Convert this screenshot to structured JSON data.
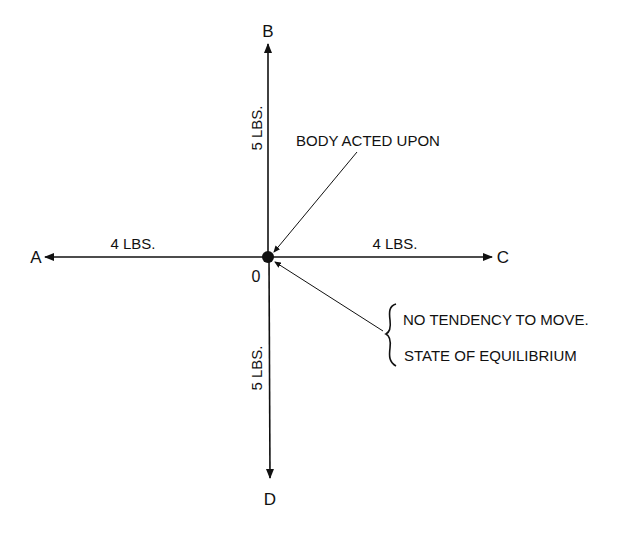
{
  "diagram": {
    "center_label": "0",
    "points": {
      "a": "A",
      "b": "B",
      "c": "C",
      "d": "D"
    },
    "forces": {
      "up": "5 LBS.",
      "down": "5 LBS.",
      "left": "4 LBS.",
      "right": "4 LBS."
    },
    "annotations": {
      "body": "BODY ACTED UPON",
      "line1": "NO TENDENCY TO MOVE.",
      "line2": "STATE OF EQUILIBRIUM"
    },
    "colors": {
      "ink": "#111111",
      "background": "#ffffff"
    }
  }
}
